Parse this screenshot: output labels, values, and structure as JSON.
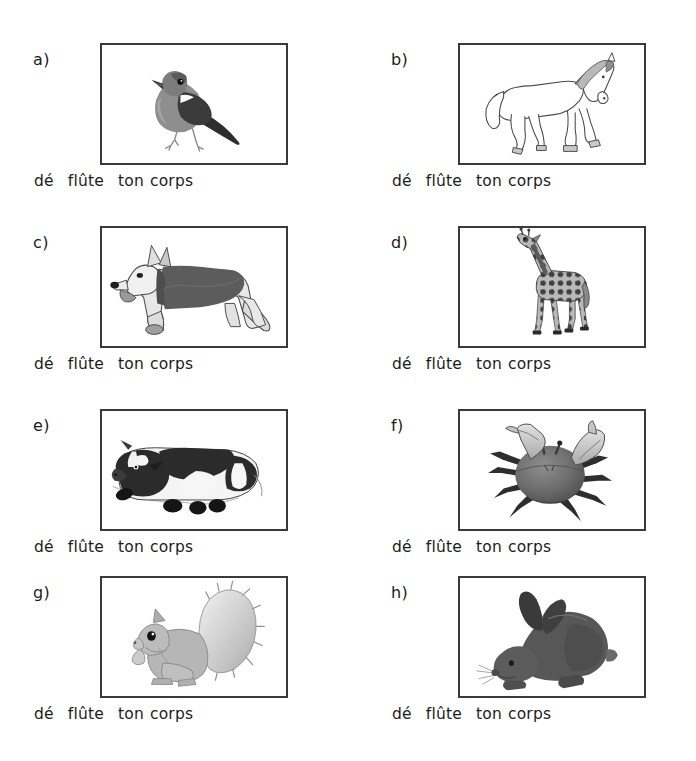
{
  "document": {
    "type": "worksheet",
    "language": "French",
    "background_color": "#ffffff",
    "border_color": "#3a3a3a",
    "text_color": "#1c1c1c"
  },
  "caption_words": {
    "w1": "dé",
    "w2": "flûte",
    "w3": "ton",
    "w4": "corps"
  },
  "panels": [
    {
      "id": "a",
      "label": "a)",
      "image_name": "bird-illustration",
      "image_alt": "bird",
      "caption": "dé flûte ton corps",
      "column": "left",
      "row": 1
    },
    {
      "id": "b",
      "label": "b)",
      "image_name": "horse-illustration",
      "image_alt": "horse",
      "caption": "dé flûte ton corps",
      "column": "right",
      "row": 1
    },
    {
      "id": "c",
      "label": "c)",
      "image_name": "dog-illustration",
      "image_alt": "dog",
      "caption": "dé flûte ton corps",
      "column": "left",
      "row": 2
    },
    {
      "id": "d",
      "label": "d)",
      "image_name": "giraffe-illustration",
      "image_alt": "giraffe",
      "caption": "dé flûte ton corps",
      "column": "right",
      "row": 2
    },
    {
      "id": "e",
      "label": "e)",
      "image_name": "cow-illustration",
      "image_alt": "cow",
      "caption": "dé flûte ton corps",
      "column": "left",
      "row": 3
    },
    {
      "id": "f",
      "label": "f)",
      "image_name": "crab-illustration",
      "image_alt": "crab",
      "caption": "dé flûte ton corps",
      "column": "right",
      "row": 3
    },
    {
      "id": "g",
      "label": "g)",
      "image_name": "squirrel-illustration",
      "image_alt": "squirrel",
      "caption": "dé flûte ton corps",
      "column": "left",
      "row": 4
    },
    {
      "id": "h",
      "label": "h)",
      "image_name": "rabbit-illustration",
      "image_alt": "rabbit",
      "caption": "dé flûte ton corps",
      "column": "right",
      "row": 4
    }
  ]
}
